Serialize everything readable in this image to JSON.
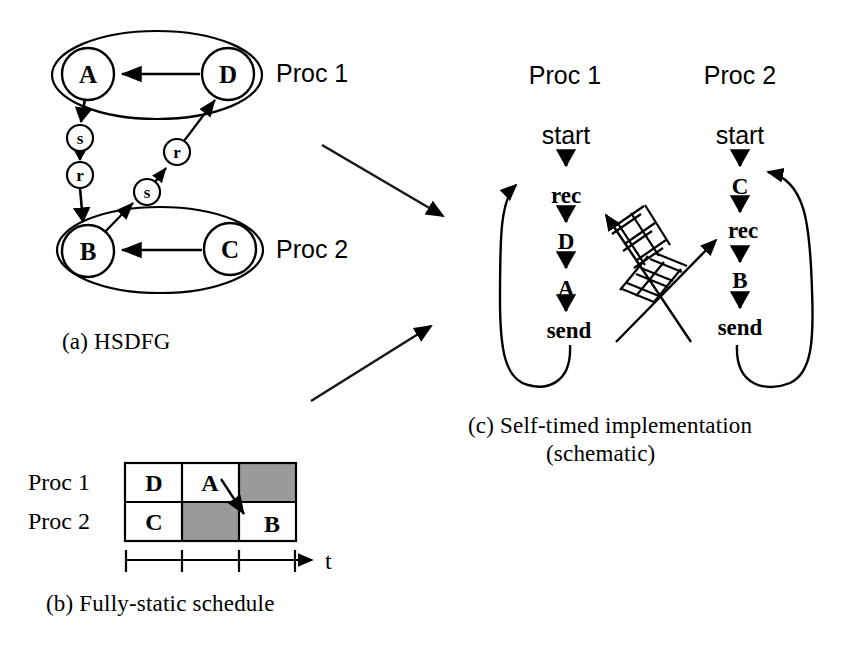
{
  "figure": {
    "background": "#ffffff",
    "ink": "#000000",
    "busy_fill": "#9a9a9a"
  },
  "panel_a": {
    "caption": "(a) HSDFG",
    "proc1_tag": "Proc 1",
    "proc2_tag": "Proc 2",
    "nodes": [
      {
        "id": "A",
        "label": "A",
        "cx": 88,
        "cy": 74,
        "r": 26,
        "group": "proc1"
      },
      {
        "id": "D",
        "label": "D",
        "cx": 228,
        "cy": 74,
        "r": 26,
        "group": "proc1"
      },
      {
        "id": "B",
        "label": "B",
        "cx": 88,
        "cy": 251,
        "r": 26,
        "group": "proc2"
      },
      {
        "id": "C",
        "label": "C",
        "cx": 230,
        "cy": 249,
        "r": 26,
        "group": "proc2"
      },
      {
        "id": "s1",
        "label": "s",
        "cx": 80,
        "cy": 138,
        "r": 13,
        "group": "link"
      },
      {
        "id": "r1",
        "label": "r",
        "cx": 80,
        "cy": 175,
        "r": 13,
        "group": "link"
      },
      {
        "id": "s2",
        "label": "s",
        "cx": 147,
        "cy": 192,
        "r": 13,
        "group": "link"
      },
      {
        "id": "r2",
        "label": "r",
        "cx": 177,
        "cy": 152,
        "r": 13,
        "group": "link"
      }
    ],
    "edges": [
      {
        "from": "D",
        "to": "A",
        "kind": "straight"
      },
      {
        "from": "C",
        "to": "B",
        "kind": "straight"
      },
      {
        "from": "A",
        "to": "s1",
        "kind": "straight"
      },
      {
        "from": "s1",
        "to": "r1",
        "kind": "straight"
      },
      {
        "from": "r1",
        "to": "B",
        "kind": "straight"
      },
      {
        "from": "B",
        "to": "s2",
        "kind": "straight"
      },
      {
        "from": "s2",
        "to": "r2",
        "kind": "straight"
      },
      {
        "from": "r2",
        "to": "D",
        "kind": "straight"
      }
    ]
  },
  "panel_b": {
    "caption": "(b) Fully-static schedule",
    "axis_label": "t",
    "row_labels": [
      "Proc 1",
      "Proc 2"
    ],
    "rows": [
      {
        "proc": "Proc 1",
        "cells": [
          {
            "label": "D",
            "busy": true
          },
          {
            "label": "A",
            "busy": true
          },
          {
            "label": "",
            "busy": false
          }
        ]
      },
      {
        "proc": "Proc 2",
        "cells": [
          {
            "label": "C",
            "busy": true
          },
          {
            "label": "",
            "busy": false
          },
          {
            "label": "B",
            "busy": true
          }
        ]
      }
    ],
    "tick_count": 4
  },
  "panel_c": {
    "caption_line1": "(c) Self-timed implementation",
    "caption_line2": "(schematic)",
    "proc1": {
      "title": "Proc 1",
      "steps": [
        "start",
        "rec",
        "D",
        "A",
        "send"
      ]
    },
    "proc2": {
      "title": "Proc 2",
      "steps": [
        "start",
        "C",
        "rec",
        "B",
        "send"
      ]
    },
    "channels": [
      {
        "from": "proc1.send",
        "to": "proc2.rec",
        "style": "fifo-ladder"
      },
      {
        "from": "proc2.send",
        "to": "proc1.rec",
        "style": "fifo-ladder"
      }
    ]
  },
  "connectors": [
    {
      "from": "panel_a",
      "to": "panel_c"
    },
    {
      "from": "panel_b",
      "to": "panel_c"
    }
  ]
}
